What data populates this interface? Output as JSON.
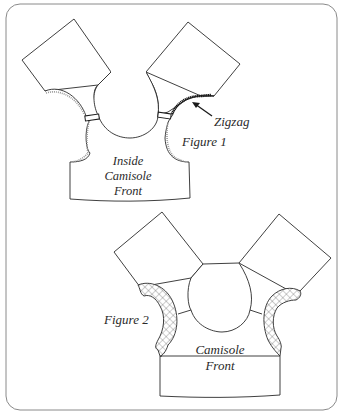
{
  "figure1": {
    "caption": "Figure 1",
    "callout": "Zigzag",
    "body_label": [
      "Inside",
      "Camisole",
      "Front"
    ]
  },
  "figure2": {
    "caption": "Figure 2",
    "body_label": [
      "Camisole",
      "Front"
    ]
  },
  "colors": {
    "line": "#2a2a2a",
    "frame": "#8a8a8a",
    "background": "#ffffff"
  }
}
